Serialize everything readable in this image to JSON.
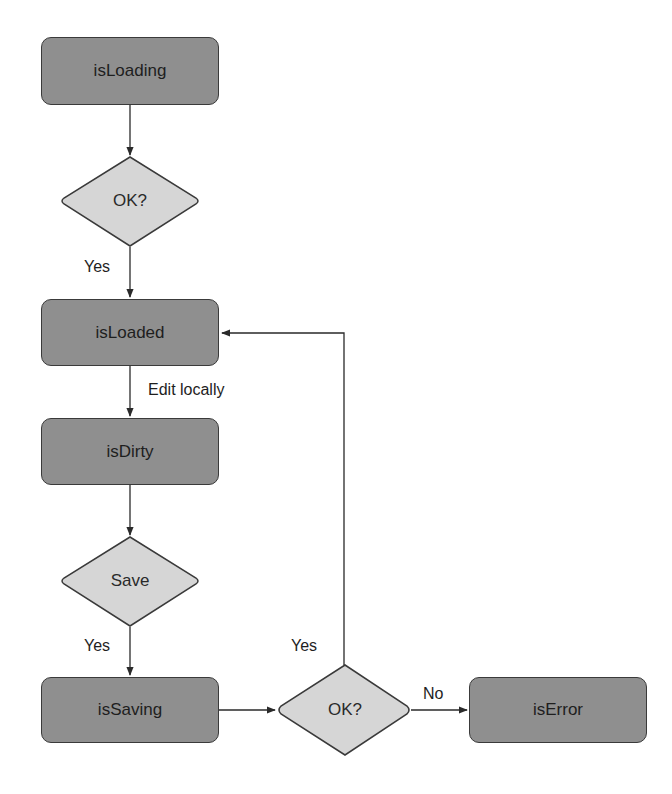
{
  "diagram": {
    "type": "flowchart",
    "colors": {
      "state_fill": "#8f8f8f",
      "decision_fill": "#d6d6d6",
      "stroke": "#3a3a3a",
      "background": "#ffffff"
    },
    "nodes": {
      "is_loading": {
        "label": "isLoading",
        "shape": "rounded-rect"
      },
      "ok_load": {
        "label": "OK?",
        "shape": "diamond"
      },
      "is_loaded": {
        "label": "isLoaded",
        "shape": "rounded-rect"
      },
      "is_dirty": {
        "label": "isDirty",
        "shape": "rounded-rect"
      },
      "save": {
        "label": "Save",
        "shape": "diamond"
      },
      "is_saving": {
        "label": "isSaving",
        "shape": "rounded-rect"
      },
      "ok_save": {
        "label": "OK?",
        "shape": "diamond"
      },
      "is_error": {
        "label": "isError",
        "shape": "rounded-rect"
      }
    },
    "edges": {
      "loading_to_ok": {
        "from": "isLoading",
        "to": "OK?",
        "label": ""
      },
      "ok_to_loaded": {
        "from": "OK?",
        "to": "isLoaded",
        "label": "Yes"
      },
      "loaded_to_dirty": {
        "from": "isLoaded",
        "to": "isDirty",
        "label": "Edit locally"
      },
      "dirty_to_save": {
        "from": "isDirty",
        "to": "Save",
        "label": ""
      },
      "save_to_saving": {
        "from": "Save",
        "to": "isSaving",
        "label": "Yes"
      },
      "saving_to_ok": {
        "from": "isSaving",
        "to": "OK?",
        "label": ""
      },
      "ok_to_loaded_return": {
        "from": "OK?",
        "to": "isLoaded",
        "label": "Yes"
      },
      "ok_to_error": {
        "from": "OK?",
        "to": "isError",
        "label": "No"
      }
    }
  }
}
